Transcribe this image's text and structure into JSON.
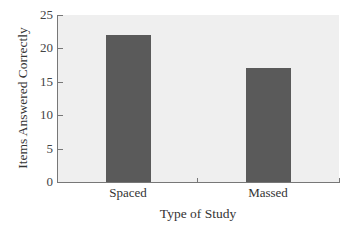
{
  "chart_data": {
    "type": "bar",
    "title": "",
    "categories": [
      "Spaced",
      "Massed"
    ],
    "values": [
      22,
      17
    ],
    "xlabel": "Type of Study",
    "ylabel": "Items Answered Correctly",
    "ylim": [
      0,
      25
    ],
    "yticks": [
      0,
      5,
      10,
      15,
      20,
      25
    ],
    "grid": false,
    "legend": null,
    "bar_color": "#5a5a5a",
    "plot_background": "#efefef"
  },
  "axis": {
    "yticks": [
      "0",
      "5",
      "10",
      "15",
      "20",
      "25"
    ]
  }
}
